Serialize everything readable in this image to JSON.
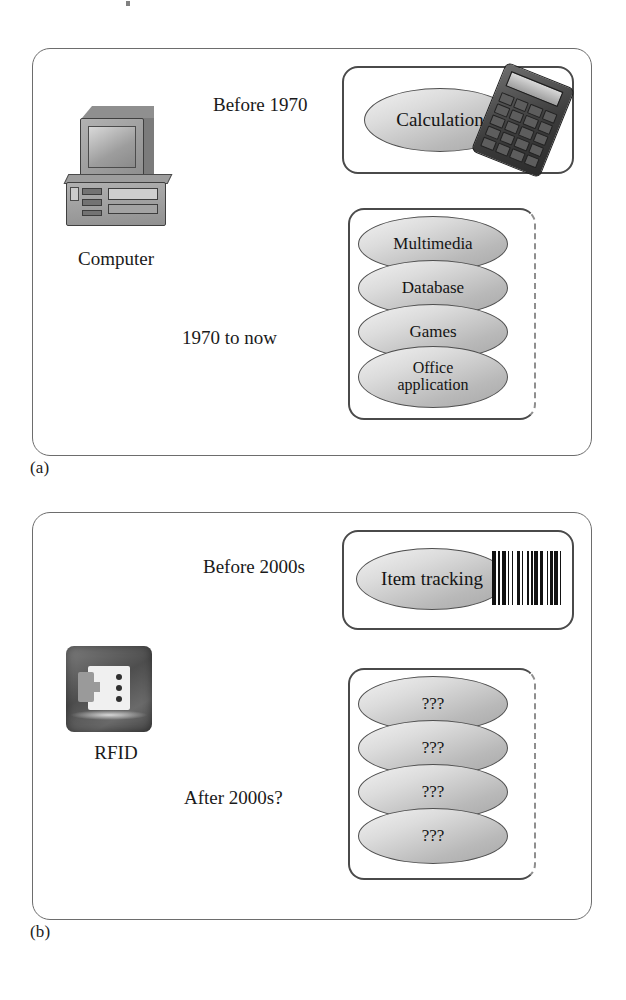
{
  "figure": {
    "panels": [
      {
        "caption": "(a)",
        "source": {
          "label": "Computer",
          "icon": "desktop-computer-icon"
        },
        "branches": [
          {
            "arrow_label": "Before 1970",
            "box": {
              "items": [
                "Calculation"
              ],
              "icon": "calculator-icon",
              "open_right": false
            }
          },
          {
            "arrow_label": "1970 to now",
            "box": {
              "items": [
                "Multimedia",
                "Database",
                "Games",
                "Office\napplication"
              ],
              "icon": null,
              "open_right": true
            }
          }
        ]
      },
      {
        "caption": "(b)",
        "source": {
          "label": "RFID",
          "icon": "rfid-tag-icon"
        },
        "branches": [
          {
            "arrow_label": "Before 2000s",
            "box": {
              "items": [
                "Item tracking"
              ],
              "icon": "barcode-icon",
              "open_right": false
            }
          },
          {
            "arrow_label": "After 2000s?",
            "box": {
              "items": [
                "???",
                "???",
                "???",
                "???"
              ],
              "icon": null,
              "open_right": true
            }
          }
        ]
      }
    ],
    "labels": {
      "calculation": "Calculation",
      "multimedia": "Multimedia",
      "database": "Database",
      "games": "Games",
      "office_line1": "Office",
      "office_line2": "application",
      "item_tracking": "Item tracking",
      "unknown": "???"
    },
    "colors": {
      "panel_border": "#6d6d6d",
      "inner_box_border": "#4a4a4a",
      "ellipse_fill_light": "#f2f2f2",
      "ellipse_fill_dark": "#a8a8a8",
      "arrow": "#1a1a1a",
      "text": "#1a1a1a",
      "background": "#ffffff"
    }
  }
}
